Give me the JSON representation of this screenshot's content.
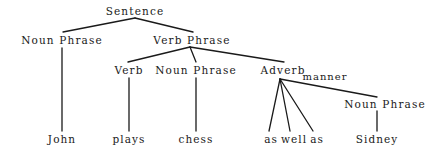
{
  "diagram": {
    "type": "syntax-parse-tree",
    "sentence": "John plays chess as well as Sidney",
    "background_color": "#ffffff",
    "line_color": "#1a1a1a",
    "text_color": "#1a1a1a",
    "nodes": [
      {
        "id": "sentence",
        "label": "Sentence",
        "x": 135,
        "y": 11,
        "kind": "nonterminal"
      },
      {
        "id": "np1",
        "label": "Noun Phrase",
        "x": 62,
        "y": 40,
        "kind": "nonterminal"
      },
      {
        "id": "vp",
        "label": "Verb Phrase",
        "x": 192,
        "y": 40,
        "kind": "nonterminal"
      },
      {
        "id": "verb",
        "label": "Verb",
        "x": 129,
        "y": 70,
        "kind": "nonterminal"
      },
      {
        "id": "np2",
        "label": "Noun Phrase",
        "x": 196,
        "y": 70,
        "kind": "nonterminal"
      },
      {
        "id": "adverb",
        "label": "Adverb",
        "x": 283,
        "y": 70,
        "kind": "nonterminal"
      },
      {
        "id": "manner",
        "label": "manner",
        "x": 325,
        "y": 77,
        "kind": "edge-label"
      },
      {
        "id": "np3",
        "label": "Noun Phrase",
        "x": 385,
        "y": 104,
        "kind": "nonterminal"
      },
      {
        "id": "john",
        "label": "John",
        "x": 62,
        "y": 139,
        "kind": "terminal"
      },
      {
        "id": "plays",
        "label": "plays",
        "x": 129,
        "y": 139,
        "kind": "terminal"
      },
      {
        "id": "chess",
        "label": "chess",
        "x": 196,
        "y": 139,
        "kind": "terminal"
      },
      {
        "id": "as1",
        "label": "as",
        "x": 271,
        "y": 139,
        "kind": "terminal"
      },
      {
        "id": "well",
        "label": "well",
        "x": 294,
        "y": 139,
        "kind": "terminal"
      },
      {
        "id": "as2",
        "label": "as",
        "x": 317,
        "y": 139,
        "kind": "terminal"
      },
      {
        "id": "sidney",
        "label": "Sidney",
        "x": 377,
        "y": 139,
        "kind": "terminal"
      }
    ],
    "edges": [
      {
        "from": "sentence",
        "to": "np1",
        "x1": 135,
        "y1": 18,
        "x2": 63,
        "y2": 32
      },
      {
        "from": "sentence",
        "to": "vp",
        "x1": 135,
        "y1": 18,
        "x2": 193,
        "y2": 32
      },
      {
        "from": "np1",
        "to": "john",
        "x1": 62,
        "y1": 48,
        "x2": 62,
        "y2": 131
      },
      {
        "from": "vp",
        "to": "verb",
        "x1": 190,
        "y1": 47,
        "x2": 128,
        "y2": 62
      },
      {
        "from": "vp",
        "to": "np2",
        "x1": 190,
        "y1": 47,
        "x2": 196,
        "y2": 62
      },
      {
        "from": "vp",
        "to": "adverb",
        "x1": 190,
        "y1": 47,
        "x2": 284,
        "y2": 62
      },
      {
        "from": "verb",
        "to": "plays",
        "x1": 129,
        "y1": 78,
        "x2": 129,
        "y2": 131
      },
      {
        "from": "np2",
        "to": "chess",
        "x1": 196,
        "y1": 78,
        "x2": 196,
        "y2": 131
      },
      {
        "from": "adverb",
        "to": "as1",
        "x1": 280,
        "y1": 79,
        "x2": 269,
        "y2": 131
      },
      {
        "from": "adverb",
        "to": "well",
        "x1": 280,
        "y1": 79,
        "x2": 290,
        "y2": 131
      },
      {
        "from": "adverb",
        "to": "as2",
        "x1": 280,
        "y1": 79,
        "x2": 313,
        "y2": 131
      },
      {
        "from": "adverb",
        "to": "np3",
        "x1": 280,
        "y1": 79,
        "x2": 377,
        "y2": 97
      },
      {
        "from": "np3",
        "to": "sidney",
        "x1": 377,
        "y1": 111,
        "x2": 377,
        "y2": 131
      }
    ]
  }
}
